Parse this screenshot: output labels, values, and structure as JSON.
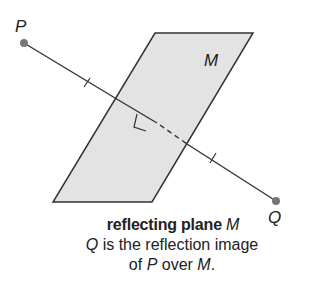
{
  "diagram": {
    "point_p": {
      "label": "P",
      "x": 24,
      "y": 43
    },
    "point_q": {
      "label": "Q",
      "x": 276,
      "y": 201
    },
    "plane": {
      "label": "M",
      "fill": "#e3e3e3",
      "corners": [
        [
          155,
          33
        ],
        [
          253,
          33
        ],
        [
          152,
          202
        ],
        [
          53,
          202
        ]
      ]
    },
    "segment_color": "#333333",
    "point_color": "#777777"
  },
  "caption": {
    "title_bold": "reflecting plane ",
    "title_var": "M",
    "line2_var": "Q",
    "line2_text": " is the reflection image",
    "line3_pre": "of ",
    "line3_var1": "P",
    "line3_mid": " over ",
    "line3_var2": "M",
    "line3_end": "."
  }
}
